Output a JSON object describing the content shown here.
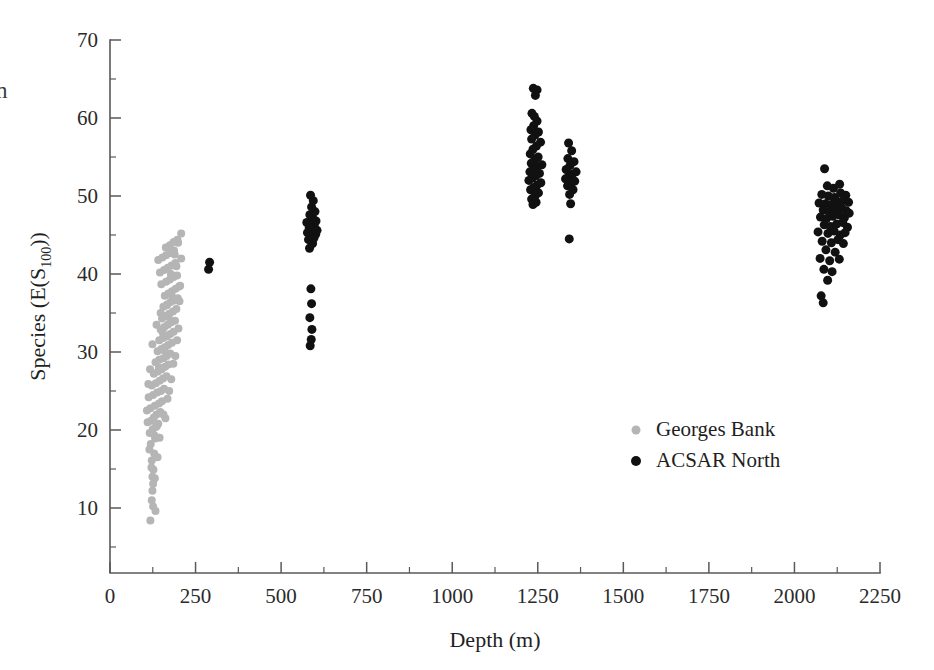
{
  "chart_data": {
    "type": "scatter",
    "title": "",
    "xlabel": "Depth (m)",
    "ylabel": "Species (E(S100))",
    "ylabel_main": "Species (E(S",
    "ylabel_sub": "100",
    "ylabel_tail": "))",
    "xlim": [
      0,
      2250
    ],
    "ylim": [
      0,
      70
    ],
    "xticks": [
      0,
      250,
      500,
      750,
      1000,
      1250,
      1500,
      1750,
      2000,
      2250
    ],
    "xticklabels": [
      "0",
      "250",
      "500",
      "750",
      "1000",
      "1250",
      "1500",
      "1750",
      "2000",
      "2250"
    ],
    "x_minor_interval": 125,
    "yticks": [
      10,
      20,
      30,
      40,
      50,
      60,
      70
    ],
    "yticklabels": [
      "10",
      "20",
      "30",
      "40",
      "50",
      "60",
      "70"
    ],
    "y_minor_interval": 5,
    "grid": false,
    "legend_position": "center-right",
    "edge_text_fragment": "n",
    "series": [
      {
        "name": "Georges Bank",
        "color": "#b5b5b5",
        "marker": "circle",
        "marker_size": 8,
        "points": [
          [
            118,
            8.4
          ],
          [
            122,
            11.0
          ],
          [
            124,
            12.2
          ],
          [
            126,
            13.1
          ],
          [
            124,
            14.0
          ],
          [
            127,
            14.9
          ],
          [
            122,
            16.1
          ],
          [
            129,
            17.0
          ],
          [
            119,
            18.2
          ],
          [
            132,
            18.9
          ],
          [
            116,
            19.6
          ],
          [
            125,
            20.1
          ],
          [
            134,
            20.4
          ],
          [
            141,
            20.8
          ],
          [
            120,
            21.2
          ],
          [
            128,
            21.6
          ],
          [
            136,
            22.0
          ],
          [
            147,
            22.3
          ],
          [
            118,
            22.8
          ],
          [
            131,
            23.1
          ],
          [
            143,
            23.4
          ],
          [
            152,
            23.7
          ],
          [
            113,
            24.2
          ],
          [
            126,
            24.5
          ],
          [
            138,
            24.8
          ],
          [
            149,
            25.0
          ],
          [
            158,
            25.3
          ],
          [
            122,
            25.7
          ],
          [
            134,
            26.0
          ],
          [
            145,
            26.3
          ],
          [
            155,
            26.6
          ],
          [
            165,
            26.9
          ],
          [
            128,
            27.2
          ],
          [
            140,
            27.5
          ],
          [
            151,
            27.8
          ],
          [
            161,
            28.1
          ],
          [
            171,
            28.4
          ],
          [
            133,
            28.7
          ],
          [
            144,
            29.0
          ],
          [
            156,
            29.2
          ],
          [
            166,
            29.5
          ],
          [
            176,
            29.8
          ],
          [
            139,
            30.1
          ],
          [
            150,
            30.4
          ],
          [
            160,
            30.6
          ],
          [
            170,
            30.9
          ],
          [
            181,
            31.2
          ],
          [
            144,
            31.5
          ],
          [
            155,
            31.8
          ],
          [
            166,
            32.0
          ],
          [
            176,
            32.3
          ],
          [
            186,
            32.6
          ],
          [
            148,
            32.9
          ],
          [
            159,
            33.2
          ],
          [
            169,
            33.5
          ],
          [
            179,
            33.8
          ],
          [
            190,
            34.0
          ],
          [
            152,
            34.3
          ],
          [
            163,
            34.6
          ],
          [
            173,
            34.9
          ],
          [
            184,
            35.2
          ],
          [
            194,
            35.5
          ],
          [
            156,
            35.8
          ],
          [
            167,
            36.1
          ],
          [
            177,
            36.4
          ],
          [
            188,
            36.6
          ],
          [
            198,
            36.9
          ],
          [
            160,
            37.2
          ],
          [
            171,
            37.5
          ],
          [
            181,
            37.8
          ],
          [
            192,
            38.1
          ],
          [
            202,
            38.4
          ],
          [
            150,
            38.7
          ],
          [
            164,
            39.0
          ],
          [
            175,
            39.3
          ],
          [
            186,
            39.6
          ],
          [
            196,
            39.8
          ],
          [
            146,
            40.2
          ],
          [
            158,
            40.5
          ],
          [
            169,
            40.8
          ],
          [
            180,
            41.1
          ],
          [
            191,
            41.4
          ],
          [
            141,
            41.8
          ],
          [
            153,
            42.1
          ],
          [
            164,
            42.4
          ],
          [
            176,
            42.7
          ],
          [
            187,
            43.0
          ],
          [
            163,
            43.4
          ],
          [
            175,
            43.7
          ],
          [
            186,
            44.1
          ],
          [
            197,
            44.4
          ],
          [
            208,
            45.2
          ],
          [
            137,
            20.5
          ],
          [
            130,
            19.3
          ],
          [
            115,
            17.5
          ],
          [
            121,
            15.2
          ],
          [
            126,
            10.2
          ],
          [
            133,
            9.6
          ],
          [
            108,
            22.5
          ],
          [
            112,
            25.9
          ],
          [
            117,
            27.8
          ],
          [
            110,
            21.0
          ],
          [
            124,
            31.0
          ],
          [
            136,
            33.5
          ],
          [
            148,
            35.0
          ],
          [
            159,
            30.2
          ],
          [
            171,
            34.5
          ],
          [
            183,
            37.0
          ],
          [
            194,
            41.0
          ],
          [
            205,
            38.5
          ],
          [
            200,
            33.0
          ],
          [
            191,
            29.5
          ],
          [
            179,
            26.5
          ],
          [
            168,
            24.0
          ],
          [
            156,
            22.0
          ],
          [
            145,
            19.0
          ],
          [
            139,
            16.5
          ],
          [
            131,
            13.8
          ],
          [
            143,
            28.0
          ],
          [
            154,
            32.5
          ],
          [
            166,
            36.0
          ],
          [
            178,
            40.0
          ],
          [
            189,
            42.5
          ],
          [
            199,
            44.0
          ],
          [
            208,
            42.0
          ],
          [
            203,
            36.5
          ],
          [
            196,
            31.5
          ],
          [
            185,
            28.5
          ],
          [
            173,
            25.0
          ],
          [
            162,
            21.5
          ]
        ]
      },
      {
        "name": "ACSAR North",
        "color": "#111111",
        "marker": "circle",
        "marker_size": 9,
        "points": [
          [
            288,
            40.6
          ],
          [
            291,
            41.5
          ],
          [
            585,
            30.8
          ],
          [
            588,
            31.6
          ],
          [
            590,
            32.9
          ],
          [
            584,
            34.4
          ],
          [
            589,
            36.2
          ],
          [
            587,
            38.1
          ],
          [
            583,
            43.3
          ],
          [
            592,
            43.9
          ],
          [
            580,
            44.4
          ],
          [
            596,
            44.6
          ],
          [
            586,
            44.9
          ],
          [
            601,
            45.1
          ],
          [
            577,
            45.3
          ],
          [
            591,
            45.5
          ],
          [
            605,
            45.6
          ],
          [
            582,
            45.9
          ],
          [
            597,
            46.1
          ],
          [
            588,
            46.4
          ],
          [
            575,
            46.6
          ],
          [
            602,
            46.8
          ],
          [
            592,
            47.2
          ],
          [
            584,
            47.6
          ],
          [
            599,
            48.0
          ],
          [
            589,
            48.6
          ],
          [
            594,
            49.4
          ],
          [
            586,
            50.1
          ],
          [
            1237,
            63.8
          ],
          [
            1248,
            63.6
          ],
          [
            1243,
            62.9
          ],
          [
            1233,
            60.6
          ],
          [
            1240,
            60.2
          ],
          [
            1248,
            59.6
          ],
          [
            1238,
            59.0
          ],
          [
            1230,
            58.5
          ],
          [
            1252,
            58.2
          ],
          [
            1242,
            57.8
          ],
          [
            1232,
            57.3
          ],
          [
            1258,
            56.9
          ],
          [
            1246,
            56.4
          ],
          [
            1236,
            56.0
          ],
          [
            1228,
            55.4
          ],
          [
            1251,
            55.0
          ],
          [
            1241,
            54.6
          ],
          [
            1231,
            54.2
          ],
          [
            1262,
            54.0
          ],
          [
            1247,
            53.7
          ],
          [
            1237,
            53.4
          ],
          [
            1227,
            53.1
          ],
          [
            1255,
            52.9
          ],
          [
            1244,
            52.6
          ],
          [
            1234,
            52.3
          ],
          [
            1224,
            52.0
          ],
          [
            1259,
            51.7
          ],
          [
            1248,
            51.4
          ],
          [
            1238,
            51.1
          ],
          [
            1229,
            50.8
          ],
          [
            1252,
            50.4
          ],
          [
            1242,
            50.0
          ],
          [
            1232,
            49.6
          ],
          [
            1245,
            49.2
          ],
          [
            1236,
            48.9
          ],
          [
            1340,
            56.8
          ],
          [
            1349,
            55.8
          ],
          [
            1338,
            54.8
          ],
          [
            1356,
            54.4
          ],
          [
            1344,
            53.9
          ],
          [
            1333,
            53.4
          ],
          [
            1362,
            53.1
          ],
          [
            1351,
            52.8
          ],
          [
            1341,
            52.5
          ],
          [
            1331,
            52.2
          ],
          [
            1358,
            51.9
          ],
          [
            1347,
            51.6
          ],
          [
            1337,
            51.3
          ],
          [
            1353,
            50.8
          ],
          [
            1343,
            50.2
          ],
          [
            1346,
            49.0
          ],
          [
            1342,
            44.5
          ],
          [
            2088,
            53.5
          ],
          [
            2096,
            51.3
          ],
          [
            2114,
            51.0
          ],
          [
            2132,
            51.5
          ],
          [
            2080,
            50.2
          ],
          [
            2099,
            50.0
          ],
          [
            2117,
            49.8
          ],
          [
            2135,
            50.4
          ],
          [
            2150,
            50.1
          ],
          [
            2072,
            49.1
          ],
          [
            2091,
            49.0
          ],
          [
            2108,
            48.9
          ],
          [
            2126,
            49.3
          ],
          [
            2144,
            49.5
          ],
          [
            2158,
            49.2
          ],
          [
            2084,
            48.2
          ],
          [
            2102,
            48.0
          ],
          [
            2120,
            48.3
          ],
          [
            2138,
            48.5
          ],
          [
            2152,
            48.1
          ],
          [
            2076,
            47.3
          ],
          [
            2094,
            47.1
          ],
          [
            2112,
            47.4
          ],
          [
            2130,
            47.6
          ],
          [
            2146,
            47.2
          ],
          [
            2160,
            47.8
          ],
          [
            2087,
            46.3
          ],
          [
            2105,
            46.1
          ],
          [
            2123,
            46.4
          ],
          [
            2141,
            46.6
          ],
          [
            2155,
            46.0
          ],
          [
            2069,
            45.4
          ],
          [
            2098,
            45.2
          ],
          [
            2116,
            45.5
          ],
          [
            2134,
            45.0
          ],
          [
            2148,
            45.3
          ],
          [
            2081,
            44.2
          ],
          [
            2108,
            44.0
          ],
          [
            2127,
            44.4
          ],
          [
            2143,
            43.9
          ],
          [
            2092,
            43.1
          ],
          [
            2119,
            42.8
          ],
          [
            2075,
            42.0
          ],
          [
            2103,
            41.7
          ],
          [
            2131,
            41.9
          ],
          [
            2086,
            40.6
          ],
          [
            2110,
            40.3
          ],
          [
            2097,
            39.2
          ],
          [
            2078,
            37.2
          ],
          [
            2084,
            36.3
          ]
        ]
      }
    ]
  },
  "legend": {
    "items": [
      {
        "label": "Georges Bank",
        "color": "#b5b5b5"
      },
      {
        "label": "ACSAR North",
        "color": "#111111"
      }
    ]
  }
}
